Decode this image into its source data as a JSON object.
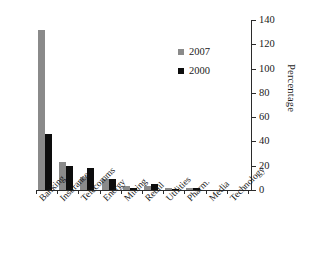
{
  "chart_data": {
    "type": "bar",
    "title": "",
    "subtitle": "",
    "xlabel": "",
    "ylabel": "Percentage",
    "ylim": [
      0,
      140
    ],
    "yticks": [
      0,
      20,
      40,
      60,
      80,
      100,
      120,
      140
    ],
    "ytick_labels": [
      "0",
      "20",
      "40",
      "60",
      "80",
      "100",
      "120",
      "140"
    ],
    "y_axis_position": "right",
    "grid": false,
    "legend_position": "upper-right-inside",
    "categories": [
      "Banking",
      "Insurance",
      "Telecomms",
      "Energy",
      "Mining",
      "Retail",
      "Utilities",
      "Pharm.",
      "Media",
      "Technology"
    ],
    "series": [
      {
        "name": "2007",
        "color": "#8a8a8a",
        "values": [
          132,
          23,
          11,
          9,
          3,
          3,
          2,
          2,
          0,
          0
        ]
      },
      {
        "name": "2000",
        "color": "#0d0d0d",
        "values": [
          46,
          20,
          18,
          9,
          2,
          5,
          1,
          2,
          0,
          0
        ]
      }
    ]
  },
  "legend": {
    "items": [
      {
        "label": "2007",
        "color": "#8a8a8a"
      },
      {
        "label": "2000",
        "color": "#0d0d0d"
      }
    ]
  },
  "axis": {
    "y_title": "Percentage"
  },
  "colors": {
    "series_2007": "#8a8a8a",
    "series_2000": "#0d0d0d",
    "axis": "#2b2b2b",
    "text": "#1a1a1a",
    "background": "#ffffff"
  }
}
